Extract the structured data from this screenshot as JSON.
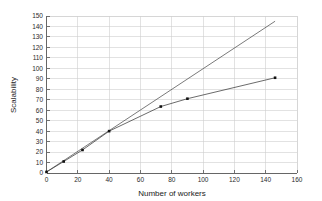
{
  "chart_data": {
    "type": "line",
    "title": "",
    "xlabel": "Number of workers",
    "ylabel": "Scalability",
    "xlim": [
      0,
      160
    ],
    "ylim": [
      0,
      150
    ],
    "xticks": [
      0,
      20,
      40,
      60,
      80,
      100,
      120,
      140,
      160
    ],
    "yticks": [
      0,
      10,
      20,
      30,
      40,
      50,
      60,
      70,
      80,
      90,
      100,
      110,
      120,
      130,
      140,
      150
    ],
    "xtick_labels": [
      "0",
      "20",
      "40",
      "60",
      "80",
      "100",
      "120",
      "140",
      "160"
    ],
    "ytick_labels": [
      "0",
      "10",
      "20",
      "30",
      "40",
      "50",
      "60",
      "70",
      "80",
      "90",
      "100",
      "110",
      "120",
      "130",
      "140",
      "150"
    ],
    "grid": true,
    "legend": null,
    "series": [
      {
        "name": "ideal",
        "markers": false,
        "color": "#4d4d4d",
        "x": [
          0,
          146
        ],
        "values": [
          1,
          145
        ]
      },
      {
        "name": "measured",
        "markers": true,
        "color": "#3a3a3a",
        "x": [
          0,
          11,
          23,
          40,
          73,
          90,
          146
        ],
        "values": [
          1,
          11,
          22,
          40,
          63.5,
          71,
          91
        ]
      }
    ]
  },
  "axes": {
    "x_title": "Number of workers",
    "y_title": "Scalability"
  },
  "style": {
    "grid_color": "#cfcfcf",
    "axis_color": "#555555",
    "line_color": "#3a3a3a",
    "marker_color": "#111111",
    "background": "#ffffff"
  }
}
